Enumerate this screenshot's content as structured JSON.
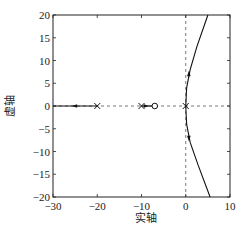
{
  "chart_data": {
    "type": "line",
    "subtype": "root-locus",
    "title": "",
    "xlabel": "实轴",
    "ylabel": "虚轴",
    "xlim": [
      -30,
      10
    ],
    "ylim": [
      -20,
      20
    ],
    "xticks": [
      -30,
      -20,
      -10,
      0,
      10
    ],
    "xtick_labels": [
      "−30",
      "−20",
      "−10",
      "0",
      "10"
    ],
    "yticks": [
      -20,
      -15,
      -10,
      -5,
      0,
      5,
      10,
      15,
      20
    ],
    "ytick_labels": [
      "−20",
      "−15",
      "−10",
      "−5",
      "0",
      "5",
      "10",
      "15",
      "20"
    ],
    "grid": false,
    "reference_lines": [
      {
        "orientation": "horizontal",
        "value": 0,
        "style": "dashed"
      },
      {
        "orientation": "vertical",
        "value": 0,
        "style": "dashed"
      }
    ],
    "poles": [
      {
        "x": -20,
        "y": 0
      },
      {
        "x": -10,
        "y": 0
      },
      {
        "x": 0,
        "y": 0
      }
    ],
    "zeros": [
      {
        "x": -7,
        "y": 0
      }
    ],
    "series": [
      {
        "name": "real-axis-branch-left",
        "points": [
          [
            -20,
            0
          ],
          [
            -30,
            0
          ]
        ],
        "arrow_at": [
          -25,
          0
        ],
        "arrow_dir": "left"
      },
      {
        "name": "real-axis-branch-mid",
        "points": [
          [
            -10,
            0
          ],
          [
            -7,
            0
          ]
        ],
        "arrow_at": [
          -9,
          0
        ],
        "arrow_dir": "right"
      },
      {
        "name": "upper-branch",
        "points": [
          [
            0,
            0
          ],
          [
            0.2,
            4
          ],
          [
            1,
            8
          ],
          [
            2.5,
            13
          ],
          [
            5,
            20
          ]
        ],
        "arrow_at": [
          0.7,
          7
        ],
        "arrow_dir": "up"
      },
      {
        "name": "lower-branch",
        "points": [
          [
            0,
            0
          ],
          [
            0.2,
            -4
          ],
          [
            1,
            -8
          ],
          [
            2.8,
            -13
          ],
          [
            5.5,
            -20
          ]
        ],
        "arrow_at": [
          0.7,
          -7
        ],
        "arrow_dir": "down"
      }
    ]
  }
}
